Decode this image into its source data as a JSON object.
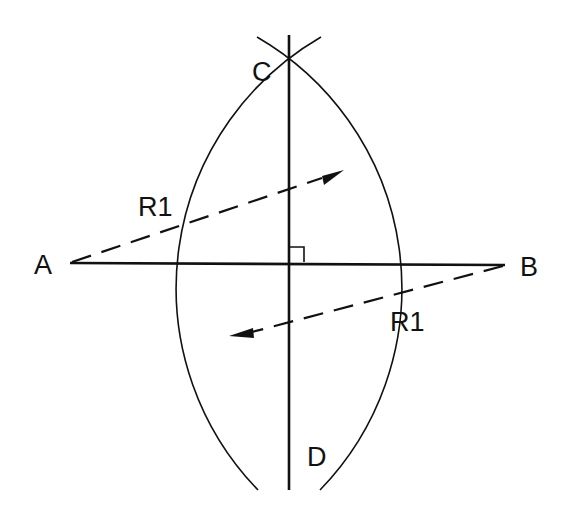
{
  "diagram": {
    "title": "",
    "type": "perpendicular-bisector-construction",
    "stroke_color": "#111111",
    "background": "#ffffff",
    "points": {
      "A": {
        "label": "A",
        "x": 70,
        "y": 263
      },
      "B": {
        "label": "B",
        "x": 505,
        "y": 265
      },
      "C": {
        "label": "C",
        "x": 289,
        "y": 68
      },
      "D": {
        "label": "D",
        "x": 289,
        "y": 453
      }
    },
    "radius_labels": [
      {
        "label": "R1",
        "x": 138,
        "y": 214
      },
      {
        "label": "R1",
        "x": 390,
        "y": 330
      }
    ],
    "right_angle_marker": {
      "x": 289,
      "y": 247,
      "size": 15
    }
  }
}
